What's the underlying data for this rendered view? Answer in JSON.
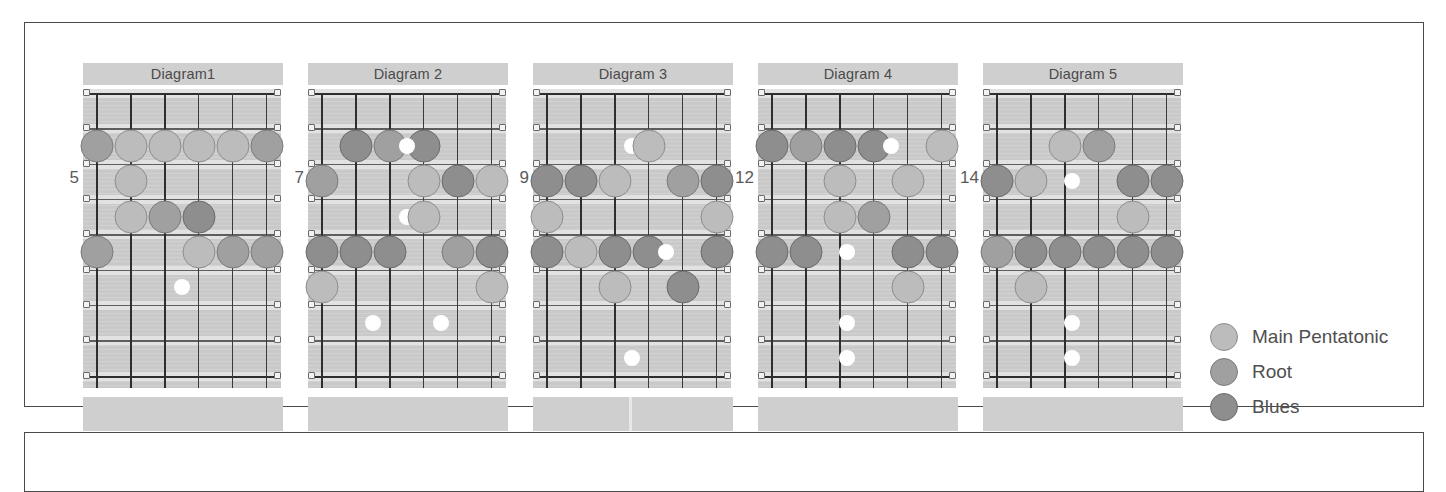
{
  "colors": {
    "main_pentatonic": "#bcbcbc",
    "root": "#a0a0a0",
    "blues": "#8e8e8e",
    "marker": "#ffffff",
    "board": "#c9c9c9",
    "title_bar": "#cfcfcf",
    "frame": "#4a4a4a",
    "text": "#4f4f4f"
  },
  "board_spec": {
    "strings": 6,
    "frets": 8,
    "orientation": "vertical",
    "description": "Guitar fretboard diagram, low string at left, nut at top"
  },
  "legend": {
    "items": [
      {
        "label": "Main Pentatonic",
        "swatch": "main"
      },
      {
        "label": "Root",
        "swatch": "root"
      },
      {
        "label": "Blues",
        "swatch": "blues"
      }
    ]
  },
  "diagrams": [
    {
      "title": "Diagram1",
      "fret_number": "5",
      "foot_split": false,
      "dots": [
        {
          "string": 1,
          "fret": 2,
          "type": "root"
        },
        {
          "string": 2,
          "fret": 2,
          "type": "main"
        },
        {
          "string": 3,
          "fret": 2,
          "type": "main"
        },
        {
          "string": 4,
          "fret": 2,
          "type": "main"
        },
        {
          "string": 5,
          "fret": 2,
          "type": "main"
        },
        {
          "string": 6,
          "fret": 2,
          "type": "root"
        },
        {
          "string": 2,
          "fret": 3,
          "type": "main"
        },
        {
          "string": 2,
          "fret": 4,
          "type": "main"
        },
        {
          "string": 3,
          "fret": 4,
          "type": "root"
        },
        {
          "string": 4,
          "fret": 4,
          "type": "blues"
        },
        {
          "string": 1,
          "fret": 5,
          "type": "root"
        },
        {
          "string": 4,
          "fret": 5,
          "type": "main"
        },
        {
          "string": 5,
          "fret": 5,
          "type": "root"
        },
        {
          "string": 6,
          "fret": 5,
          "type": "root"
        },
        {
          "string": 3.5,
          "fret": 6,
          "type": "marker"
        }
      ]
    },
    {
      "title": "Diagram 2",
      "fret_number": "7",
      "foot_split": false,
      "dots": [
        {
          "string": 2,
          "fret": 2,
          "type": "blues"
        },
        {
          "string": 3,
          "fret": 2,
          "type": "root"
        },
        {
          "string": 4,
          "fret": 2,
          "type": "blues"
        },
        {
          "string": 3.5,
          "fret": 2,
          "type": "marker"
        },
        {
          "string": 1,
          "fret": 3,
          "type": "root"
        },
        {
          "string": 4,
          "fret": 3,
          "type": "main"
        },
        {
          "string": 5,
          "fret": 3,
          "type": "blues"
        },
        {
          "string": 6,
          "fret": 3,
          "type": "main"
        },
        {
          "string": 3.5,
          "fret": 4,
          "type": "marker"
        },
        {
          "string": 4,
          "fret": 4,
          "type": "main"
        },
        {
          "string": 1,
          "fret": 5,
          "type": "blues"
        },
        {
          "string": 2,
          "fret": 5,
          "type": "blues"
        },
        {
          "string": 3,
          "fret": 5,
          "type": "blues"
        },
        {
          "string": 5,
          "fret": 5,
          "type": "root"
        },
        {
          "string": 6,
          "fret": 5,
          "type": "blues"
        },
        {
          "string": 1,
          "fret": 6,
          "type": "main"
        },
        {
          "string": 6,
          "fret": 6,
          "type": "main"
        },
        {
          "string": 2.5,
          "fret": 7,
          "type": "marker"
        },
        {
          "string": 4.5,
          "fret": 7,
          "type": "marker"
        }
      ]
    },
    {
      "title": "Diagram 3",
      "fret_number": "9",
      "foot_split": true,
      "dots": [
        {
          "string": 3.5,
          "fret": 2,
          "type": "marker"
        },
        {
          "string": 4,
          "fret": 2,
          "type": "main"
        },
        {
          "string": 1,
          "fret": 3,
          "type": "blues"
        },
        {
          "string": 2,
          "fret": 3,
          "type": "blues"
        },
        {
          "string": 3,
          "fret": 3,
          "type": "main"
        },
        {
          "string": 5,
          "fret": 3,
          "type": "root"
        },
        {
          "string": 6,
          "fret": 3,
          "type": "blues"
        },
        {
          "string": 1,
          "fret": 4,
          "type": "main"
        },
        {
          "string": 6,
          "fret": 4,
          "type": "main"
        },
        {
          "string": 1,
          "fret": 5,
          "type": "blues"
        },
        {
          "string": 2,
          "fret": 5,
          "type": "main"
        },
        {
          "string": 3,
          "fret": 5,
          "type": "blues"
        },
        {
          "string": 4,
          "fret": 5,
          "type": "blues"
        },
        {
          "string": 4.5,
          "fret": 5,
          "type": "marker"
        },
        {
          "string": 6,
          "fret": 5,
          "type": "blues"
        },
        {
          "string": 3,
          "fret": 6,
          "type": "main"
        },
        {
          "string": 5,
          "fret": 6,
          "type": "blues"
        },
        {
          "string": 3.5,
          "fret": 8,
          "type": "marker"
        }
      ]
    },
    {
      "title": "Diagram 4",
      "fret_number": "12",
      "foot_split": false,
      "dots": [
        {
          "string": 1,
          "fret": 2,
          "type": "blues"
        },
        {
          "string": 2,
          "fret": 2,
          "type": "root"
        },
        {
          "string": 3,
          "fret": 2,
          "type": "blues"
        },
        {
          "string": 4,
          "fret": 2,
          "type": "blues"
        },
        {
          "string": 4.5,
          "fret": 2,
          "type": "marker"
        },
        {
          "string": 6,
          "fret": 2,
          "type": "main"
        },
        {
          "string": 3,
          "fret": 3,
          "type": "main"
        },
        {
          "string": 5,
          "fret": 3,
          "type": "main"
        },
        {
          "string": 3,
          "fret": 4,
          "type": "main"
        },
        {
          "string": 4,
          "fret": 4,
          "type": "root"
        },
        {
          "string": 1,
          "fret": 5,
          "type": "blues"
        },
        {
          "string": 2,
          "fret": 5,
          "type": "blues"
        },
        {
          "string": 3.2,
          "fret": 5,
          "type": "marker"
        },
        {
          "string": 5,
          "fret": 5,
          "type": "blues"
        },
        {
          "string": 6,
          "fret": 5,
          "type": "blues"
        },
        {
          "string": 5,
          "fret": 6,
          "type": "main"
        },
        {
          "string": 3.2,
          "fret": 7,
          "type": "marker"
        },
        {
          "string": 3.2,
          "fret": 8,
          "type": "marker"
        }
      ]
    },
    {
      "title": "Diagram 5",
      "fret_number": "14",
      "foot_split": false,
      "dots": [
        {
          "string": 3,
          "fret": 2,
          "type": "main"
        },
        {
          "string": 4,
          "fret": 2,
          "type": "root"
        },
        {
          "string": 1,
          "fret": 3,
          "type": "blues"
        },
        {
          "string": 2,
          "fret": 3,
          "type": "main"
        },
        {
          "string": 3.2,
          "fret": 3,
          "type": "marker"
        },
        {
          "string": 5,
          "fret": 3,
          "type": "blues"
        },
        {
          "string": 6,
          "fret": 3,
          "type": "blues"
        },
        {
          "string": 5,
          "fret": 4,
          "type": "main"
        },
        {
          "string": 1,
          "fret": 5,
          "type": "root"
        },
        {
          "string": 2,
          "fret": 5,
          "type": "blues"
        },
        {
          "string": 3,
          "fret": 5,
          "type": "blues"
        },
        {
          "string": 4,
          "fret": 5,
          "type": "blues"
        },
        {
          "string": 5,
          "fret": 5,
          "type": "blues"
        },
        {
          "string": 6,
          "fret": 5,
          "type": "blues"
        },
        {
          "string": 2,
          "fret": 6,
          "type": "main"
        },
        {
          "string": 3.2,
          "fret": 7,
          "type": "marker"
        },
        {
          "string": 3.2,
          "fret": 8,
          "type": "marker"
        }
      ]
    }
  ]
}
